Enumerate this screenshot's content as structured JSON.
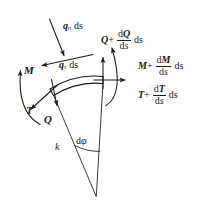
{
  "figure": {
    "kind": "free-body-diagram-curved-beam-element",
    "background_color": "#ffffff",
    "stroke_color": "#1a1a1a"
  },
  "labels": {
    "q_n_symbol": "q",
    "q_n_subscript": "n",
    "q_n_ds": "ds",
    "q_tau_symbol": "q",
    "q_tau_subscript": "τ",
    "q_tau_ds": "ds",
    "M_left": "M",
    "T_left": "T",
    "Q_left": "Q",
    "k": "k",
    "dphi_d": "d",
    "dphi_phi": "φ",
    "Q_right_sym": "Q",
    "Q_right_plus": "+",
    "Q_right_num_d": "d",
    "Q_right_num_sym": "Q",
    "Q_right_den": "ds",
    "Q_right_ds": "ds",
    "M_right_sym": "M",
    "M_right_plus": "+",
    "M_right_num_d": "d",
    "M_right_num_sym": "M",
    "M_right_den": "ds",
    "M_right_ds": "ds",
    "T_right_sym": "T",
    "T_right_plus": "+",
    "T_right_num_d": "d",
    "T_right_num_sym": "T",
    "T_right_den": "ds",
    "T_right_ds": "ds"
  },
  "colors": {
    "ink": "#1a1a1a",
    "paper": "#ffffff",
    "thin": "#555555"
  }
}
